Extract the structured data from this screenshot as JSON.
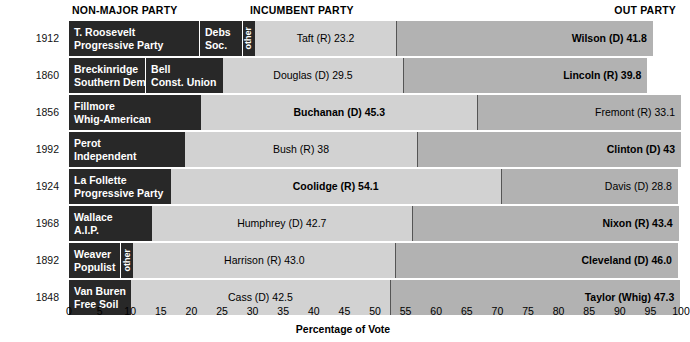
{
  "headers": {
    "non_major": "NON-MAJOR PARTY",
    "incumbent": "INCUMBENT PARTY",
    "out": "OUT PARTY"
  },
  "axis": {
    "title": "Percentage of Vote",
    "ticks": [
      "0",
      "5",
      "10",
      "15",
      "20",
      "25",
      "30",
      "35",
      "40",
      "45",
      "50",
      "55",
      "60",
      "65",
      "70",
      "75",
      "80",
      "85",
      "90",
      "95",
      "100"
    ],
    "min": 0,
    "max": 100,
    "step": 5
  },
  "colors": {
    "non_major": "#282828",
    "incumbent": "#d2d2d2",
    "out_party": "#b2b2b2",
    "background": "#ffffff",
    "text_light": "#ffffff",
    "text_dark": "#000000"
  },
  "chart_data": {
    "type": "bar",
    "orientation": "horizontal-stacked",
    "title": "",
    "xlabel": "Percentage of Vote",
    "ylabel": "",
    "xlim": [
      0,
      100
    ],
    "grid": false,
    "categories": [
      "1912",
      "1860",
      "1856",
      "1992",
      "1924",
      "1968",
      "1892",
      "1848"
    ],
    "rows": [
      {
        "year": "1912",
        "segments": [
          {
            "kind": "non_major",
            "lines": [
              "T. Roosevelt",
              "Progressive Party"
            ],
            "value": 21.4,
            "label": ""
          },
          {
            "kind": "non_major",
            "lines": [
              "Debs",
              "Soc."
            ],
            "value": 7.0,
            "label": ""
          },
          {
            "kind": "non_major",
            "lines": [
              "other"
            ],
            "value": 2.0,
            "vertical": true,
            "label": ""
          },
          {
            "kind": "incumbent",
            "lines": [
              "Taft (R) 23.2"
            ],
            "value": 23.2,
            "winner": false
          },
          {
            "kind": "out_party",
            "lines": [
              "Wilson (D) 41.8"
            ],
            "value": 41.8,
            "winner": true
          }
        ]
      },
      {
        "year": "1860",
        "segments": [
          {
            "kind": "non_major",
            "lines": [
              "Breckinridge",
              "Southern Democrat"
            ],
            "value": 12.6,
            "label": ""
          },
          {
            "kind": "non_major",
            "lines": [
              "Bell",
              "Const. Union"
            ],
            "value": 12.6,
            "label": ""
          },
          {
            "kind": "incumbent",
            "lines": [
              "Douglas (D) 29.5"
            ],
            "value": 29.5,
            "winner": false
          },
          {
            "kind": "out_party",
            "lines": [
              "Lincoln (R) 39.8"
            ],
            "value": 39.8,
            "winner": true
          }
        ]
      },
      {
        "year": "1856",
        "segments": [
          {
            "kind": "non_major",
            "lines": [
              "Fillmore",
              "Whig-American"
            ],
            "value": 21.6,
            "label": ""
          },
          {
            "kind": "incumbent",
            "lines": [
              "Buchanan (D) 45.3"
            ],
            "value": 45.3,
            "winner": true
          },
          {
            "kind": "out_party",
            "lines": [
              "Fremont (R) 33.1"
            ],
            "value": 33.1,
            "winner": false
          }
        ]
      },
      {
        "year": "1992",
        "segments": [
          {
            "kind": "non_major",
            "lines": [
              "Perot",
              "Independent"
            ],
            "value": 19.0,
            "label": ""
          },
          {
            "kind": "incumbent",
            "lines": [
              "Bush (R) 38"
            ],
            "value": 38.0,
            "winner": false
          },
          {
            "kind": "out_party",
            "lines": [
              "Clinton (D) 43"
            ],
            "value": 43.0,
            "winner": true
          }
        ]
      },
      {
        "year": "1924",
        "segments": [
          {
            "kind": "non_major",
            "lines": [
              "La Follette",
              "Progressive Party"
            ],
            "value": 16.6,
            "label": ""
          },
          {
            "kind": "incumbent",
            "lines": [
              "Coolidge (R) 54.1"
            ],
            "value": 54.1,
            "winner": true
          },
          {
            "kind": "out_party",
            "lines": [
              "Davis (D) 28.8"
            ],
            "value": 28.8,
            "winner": false
          }
        ]
      },
      {
        "year": "1968",
        "segments": [
          {
            "kind": "non_major",
            "lines": [
              "Wallace",
              "A.I.P."
            ],
            "value": 13.5,
            "label": ""
          },
          {
            "kind": "incumbent",
            "lines": [
              "Humphrey (D) 42.7"
            ],
            "value": 42.7,
            "winner": false
          },
          {
            "kind": "out_party",
            "lines": [
              "Nixon (R) 43.4"
            ],
            "value": 43.4,
            "winner": true
          }
        ]
      },
      {
        "year": "1892",
        "segments": [
          {
            "kind": "non_major",
            "lines": [
              "Weaver",
              "Populist"
            ],
            "value": 8.5,
            "label": ""
          },
          {
            "kind": "non_major",
            "lines": [
              "other"
            ],
            "value": 2.0,
            "vertical": true,
            "label": ""
          },
          {
            "kind": "incumbent",
            "lines": [
              "Harrison (R) 43.0"
            ],
            "value": 43.0,
            "winner": false
          },
          {
            "kind": "out_party",
            "lines": [
              "Cleveland (D) 46.0"
            ],
            "value": 46.0,
            "winner": true
          }
        ]
      },
      {
        "year": "1848",
        "segments": [
          {
            "kind": "non_major",
            "lines": [
              "Van Buren",
              "Free Soil"
            ],
            "value": 10.1,
            "label": ""
          },
          {
            "kind": "incumbent",
            "lines": [
              "Cass (D) 42.5"
            ],
            "value": 42.5,
            "winner": false
          },
          {
            "kind": "out_party",
            "lines": [
              "Taylor (Whig) 47.3"
            ],
            "value": 47.3,
            "winner": true
          }
        ]
      }
    ]
  }
}
